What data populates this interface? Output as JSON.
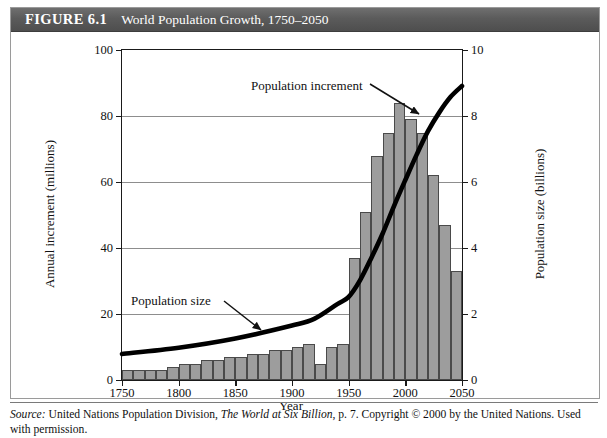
{
  "figure": {
    "number_label": "FIGURE 6.1",
    "title": "World Population Growth, 1750–2050"
  },
  "source": {
    "label": "Source:",
    "text": " United Nations Population Division, ",
    "publication": "The World at Six Billion",
    "text_after": ", p. 7. Copyright © 2000 by the United Nations. Used with permission."
  },
  "annotations": {
    "increment_label": "Population increment",
    "size_label": "Population size"
  },
  "chart_data": {
    "type": "bar",
    "title": "World Population Growth, 1750–2050",
    "xlabel": "Year",
    "ylabel": "Annual increment (millions)",
    "y2label": "Population size (billions)",
    "xlim": [
      1750,
      2050
    ],
    "ylim": [
      0,
      100
    ],
    "y2lim": [
      0,
      10
    ],
    "xticks": [
      1750,
      1800,
      1850,
      1900,
      1950,
      2000,
      2050
    ],
    "xticklabels": [
      "1750",
      "1800",
      "1850",
      "1900",
      "1950",
      "2000",
      "2050"
    ],
    "yticks": [
      0,
      20,
      40,
      60,
      80,
      100
    ],
    "yticklabels": [
      "0",
      "20",
      "40",
      "60",
      "80",
      "100"
    ],
    "y2ticks": [
      0,
      2,
      4,
      6,
      8,
      10
    ],
    "y2ticklabels": [
      "0",
      "2",
      "4",
      "6",
      "8",
      "10"
    ],
    "grid": true,
    "grid_axis": "y",
    "legend": "none",
    "bar_color": "#9d9d9d",
    "bar_edge_color": "#4a4a4a",
    "line_color": "#000000",
    "bar_width_years": 10,
    "categories": [
      "1750",
      "1760",
      "1770",
      "1780",
      "1790",
      "1800",
      "1810",
      "1820",
      "1830",
      "1840",
      "1850",
      "1860",
      "1870",
      "1880",
      "1890",
      "1900",
      "1910",
      "1920",
      "1930",
      "1940",
      "1950",
      "1960",
      "1970",
      "1980",
      "1990",
      "2000",
      "2010",
      "2020",
      "2030",
      "2040"
    ],
    "series": [
      {
        "name": "Population increment",
        "type": "bar",
        "axis": "left",
        "unit": "millions per year",
        "values": [
          3,
          3,
          3,
          3,
          4,
          5,
          5,
          6,
          6,
          7,
          7,
          8,
          8,
          9,
          9,
          10,
          11,
          5,
          10,
          11,
          37,
          51,
          68,
          75,
          84,
          79,
          75,
          62,
          47,
          33
        ]
      },
      {
        "name": "Population size",
        "type": "line",
        "axis": "right",
        "unit": "billions",
        "x": [
          1750,
          1800,
          1850,
          1900,
          1920,
          1940,
          1950,
          1960,
          1970,
          1980,
          1990,
          2000,
          2010,
          2020,
          2030,
          2040,
          2050
        ],
        "values": [
          0.79,
          0.98,
          1.26,
          1.65,
          1.86,
          2.3,
          2.52,
          3.02,
          3.7,
          4.44,
          5.27,
          6.06,
          6.83,
          7.54,
          8.11,
          8.58,
          8.91
        ]
      }
    ]
  }
}
